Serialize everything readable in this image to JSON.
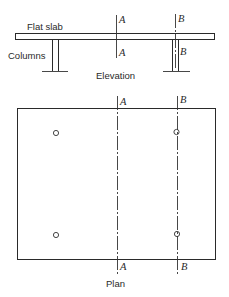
{
  "elevation": {
    "title": "Elevation",
    "slab_label": "Flat slab",
    "columns_label": "Columns",
    "section_a_top": "A",
    "section_a_bottom": "A",
    "section_b_top": "B",
    "section_b_bottom": "B"
  },
  "plan": {
    "title": "Plan",
    "section_a_top": "A",
    "section_a_bottom": "A",
    "section_b_top": "B",
    "section_b_bottom": "B",
    "column_markers": [
      {
        "x": 56,
        "y": 133
      },
      {
        "x": 176,
        "y": 132
      },
      {
        "x": 56,
        "y": 235
      },
      {
        "x": 177,
        "y": 234
      }
    ]
  },
  "colors": {
    "line": "#2a2a2a",
    "background": "#ffffff"
  }
}
